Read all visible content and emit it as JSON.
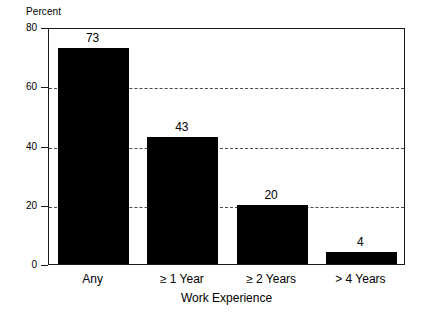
{
  "chart_data": {
    "type": "bar",
    "title": "",
    "xlabel": "Work Experience",
    "ylabel": "Percent",
    "categories": [
      "Any",
      "≥ 1 Year",
      "≥ 2 Years",
      "> 4 Years"
    ],
    "values": [
      73,
      43,
      20,
      4
    ],
    "value_labels": [
      "73",
      "43",
      "20",
      "4"
    ],
    "ylim": [
      0,
      80
    ],
    "yticks": [
      0,
      20,
      40,
      60,
      80
    ],
    "ytick_labels": [
      "0",
      "20",
      "40",
      "60",
      "80"
    ],
    "gridlines_at": [
      20,
      40,
      60
    ],
    "grid": true,
    "grid_style": "dashed",
    "legend": null,
    "legend_position": "none",
    "bar_color": "#000000",
    "axis_color": "#1a1a1a",
    "grid_color": "#4a4a4a",
    "background": "#ffffff"
  },
  "axes": {
    "y_title": "Percent",
    "x_title": "Work Experience"
  }
}
